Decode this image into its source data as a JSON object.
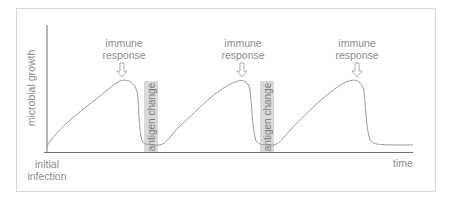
{
  "diagram": {
    "y_axis_label": "microbial growth",
    "x_axis_label": "time",
    "origin_label_line1": "initial",
    "origin_label_line2": "infection",
    "immune_responses": [
      {
        "line1": "immune",
        "line2": "response"
      },
      {
        "line1": "immune",
        "line2": "response"
      },
      {
        "line1": "immune",
        "line2": "response"
      }
    ],
    "antigen_changes": [
      {
        "label": "antigen change"
      },
      {
        "label": "antigen change"
      }
    ],
    "colors": {
      "curve": "#9a9a9a",
      "axis": "#6e6e6e",
      "highlight": "#d9d9d9",
      "frame": "#d8d8d8"
    }
  }
}
